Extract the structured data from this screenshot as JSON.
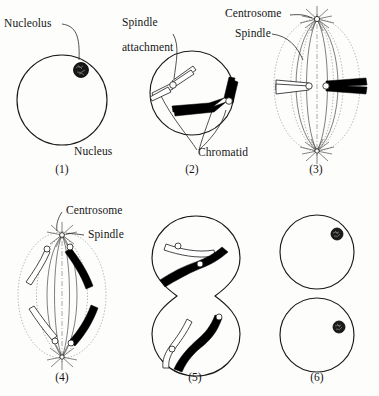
{
  "figure": {
    "background_color": "#fdfdfc",
    "ink_color": "#1a1a1a",
    "columns": 3,
    "rows": 2
  },
  "labels": {
    "nucleolus": "Nucleolus",
    "nucleus": "Nucleus",
    "spindle_attachment_line1": "Spindle",
    "spindle_attachment_line2": "attachment",
    "chromatid": "Chromatid",
    "centrosome_top": "Centrosome",
    "spindle_top": "Spindle",
    "centrosome_bottom": "Centrosome",
    "spindle_bottom": "Spindle"
  },
  "panels": [
    {
      "number": "(1)",
      "stage": "interphase",
      "description": "Round nucleus containing a single dark nucleolus",
      "labels": [
        "Nucleolus",
        "Nucleus"
      ],
      "features": {
        "nucleus_outline": true,
        "nucleolus_count": 1,
        "chromosome_count": 0,
        "spindle": false,
        "centrosomes": 0
      }
    },
    {
      "number": "(2)",
      "stage": "prophase",
      "description": "Condensed chromosomes with spindle attachment points inside nuclear boundary",
      "labels": [
        "Spindle attachment",
        "Chromatid"
      ],
      "features": {
        "nucleus_outline": true,
        "nucleolus_count": 0,
        "chromosome_count": 2,
        "chromosome_colors": [
          "white",
          "black"
        ],
        "kinetochore_count": 2,
        "spindle": false,
        "centrosomes": 0
      }
    },
    {
      "number": "(3)",
      "stage": "metaphase",
      "description": "Chromosomes aligned at the equatorial plate between two centrosomes",
      "labels": [
        "Centrosome",
        "Spindle"
      ],
      "features": {
        "nucleus_outline": false,
        "chromosome_count": 2,
        "chromosome_colors": [
          "white",
          "black"
        ],
        "kinetochore_count": 2,
        "spindle": true,
        "centrosomes": 2,
        "spindle_fiber_count": 10
      }
    },
    {
      "number": "(4)",
      "stage": "anaphase",
      "description": "Sister chromatids pulled toward opposite poles of the spindle",
      "labels": [
        "Centrosome",
        "Spindle"
      ],
      "features": {
        "nucleus_outline": false,
        "chromatid_count": 4,
        "chromosome_colors": [
          "white",
          "white",
          "black",
          "black"
        ],
        "kinetochore_count": 4,
        "spindle": true,
        "centrosomes": 2
      }
    },
    {
      "number": "(5)",
      "stage": "telophase",
      "description": "Cell constricting into two lobes, chromosomes decondensing in each lobe",
      "labels": [],
      "features": {
        "nucleus_outline": true,
        "cell_lobes": 2,
        "chromatid_count": 4,
        "chromosome_colors": [
          "white",
          "black",
          "white",
          "black"
        ],
        "kinetochore_count": 4,
        "spindle": false,
        "centrosomes": 0
      }
    },
    {
      "number": "(6)",
      "stage": "daughter cells",
      "description": "Two separate daughter cells each with a reformed nucleolus",
      "labels": [],
      "features": {
        "nucleus_outline": true,
        "cell_count": 2,
        "nucleolus_count": 2,
        "chromosome_count": 0,
        "spindle": false,
        "centrosomes": 0
      }
    }
  ]
}
